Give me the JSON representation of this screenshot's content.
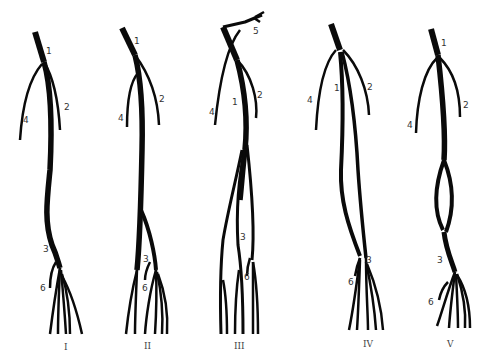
{
  "figure": {
    "variants": [
      {
        "numeral": "I",
        "labels": {
          "1": "1",
          "2": "2",
          "3": "3",
          "4": "4",
          "6": "6"
        }
      },
      {
        "numeral": "II",
        "labels": {
          "1": "1",
          "2": "2",
          "3": "3",
          "4": "4",
          "6": "6"
        }
      },
      {
        "numeral": "III",
        "labels": {
          "1": "1",
          "2": "2",
          "3": "3",
          "4": "4",
          "5": "5",
          "6": "6"
        }
      },
      {
        "numeral": "IV",
        "labels": {
          "1": "1",
          "2": "2",
          "3": "3",
          "4": "4",
          "6": "6"
        }
      },
      {
        "numeral": "V",
        "labels": {
          "1": "1",
          "2": "2",
          "3": "3",
          "4": "4",
          "6": "6"
        }
      }
    ],
    "colors": {
      "vessel": "#0a0a0a",
      "label": "#333333",
      "background": "#ffffff"
    }
  }
}
